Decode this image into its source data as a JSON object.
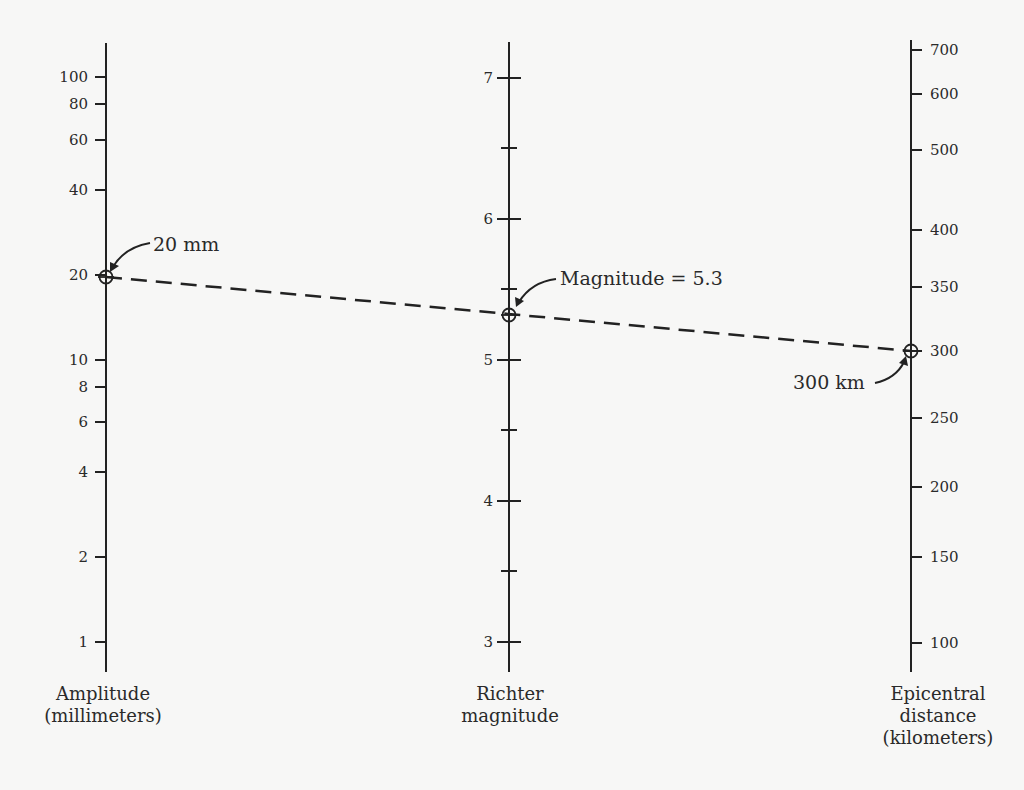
{
  "chart_data": {
    "type": "nomogram",
    "title": "",
    "axes": [
      {
        "id": "amplitude",
        "title_lines": [
          "Amplitude",
          "(millimeters)"
        ],
        "scale": "log",
        "x": 106,
        "y_top": 43,
        "y_bottom": 672,
        "label_side": "left",
        "ticks": [
          {
            "value": "100",
            "y": 77
          },
          {
            "value": "80",
            "y": 104
          },
          {
            "value": "60",
            "y": 140
          },
          {
            "value": "40",
            "y": 190
          },
          {
            "value": "20",
            "y": 275
          },
          {
            "value": "10",
            "y": 360
          },
          {
            "value": "8",
            "y": 387
          },
          {
            "value": "6",
            "y": 422
          },
          {
            "value": "4",
            "y": 472
          },
          {
            "value": "2",
            "y": 557
          },
          {
            "value": "1",
            "y": 642
          }
        ]
      },
      {
        "id": "richter",
        "title_lines": [
          "Richter",
          "magnitude"
        ],
        "scale": "linear",
        "x": 509,
        "y_top": 42,
        "y_bottom": 672,
        "label_side": "left",
        "ticks": [
          {
            "value": "7",
            "y": 78,
            "major": true
          },
          {
            "value": "",
            "y": 148,
            "major": false
          },
          {
            "value": "6",
            "y": 219,
            "major": true
          },
          {
            "value": "",
            "y": 289,
            "major": false
          },
          {
            "value": "5",
            "y": 360,
            "major": true
          },
          {
            "value": "",
            "y": 430,
            "major": false
          },
          {
            "value": "4",
            "y": 501,
            "major": true
          },
          {
            "value": "",
            "y": 571,
            "major": false
          },
          {
            "value": "3",
            "y": 642,
            "major": true
          }
        ]
      },
      {
        "id": "distance",
        "title_lines": [
          "Epicentral",
          "distance",
          "(kilometers)"
        ],
        "scale": "nonlinear",
        "x": 911,
        "y_top": 40,
        "y_bottom": 672,
        "label_side": "right",
        "ticks": [
          {
            "value": "700",
            "y": 50
          },
          {
            "value": "600",
            "y": 94
          },
          {
            "value": "500",
            "y": 150
          },
          {
            "value": "400",
            "y": 230
          },
          {
            "value": "350",
            "y": 287
          },
          {
            "value": "300",
            "y": 351
          },
          {
            "value": "250",
            "y": 418
          },
          {
            "value": "200",
            "y": 487
          },
          {
            "value": "150",
            "y": 557
          },
          {
            "value": "100",
            "y": 643
          }
        ]
      }
    ],
    "example_line": {
      "style": "dashed",
      "points": [
        {
          "axis": "amplitude",
          "value": 20,
          "unit": "mm",
          "x": 106,
          "y": 277,
          "label": "20 mm"
        },
        {
          "axis": "richter",
          "value": 5.3,
          "x": 509,
          "y": 315,
          "label": "Magnitude = 5.3"
        },
        {
          "axis": "distance",
          "value": 300,
          "unit": "km",
          "x": 911,
          "y": 351,
          "label": "300 km"
        }
      ]
    }
  }
}
